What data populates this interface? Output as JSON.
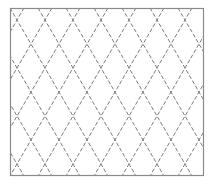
{
  "figure": {
    "frame": {
      "x": 10,
      "y": 8,
      "width": 194,
      "height": 168
    },
    "border_color": "#8a8a8a",
    "line_color": "#7a7a7a",
    "background": "#ffffff",
    "pattern": {
      "type": "diagonal-crosshatch",
      "period_x": 28,
      "period_y": 24,
      "dash": "4 2"
    }
  }
}
